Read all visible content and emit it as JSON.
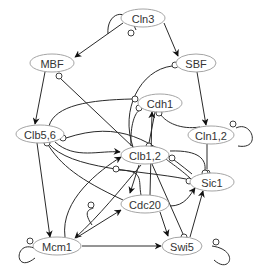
{
  "nodes": [
    {
      "id": "Cln3",
      "label": "Cln3"
    },
    {
      "id": "MBF",
      "label": "MBF"
    },
    {
      "id": "SBF",
      "label": "SBF"
    },
    {
      "id": "Cdh1",
      "label": "Cdh1"
    },
    {
      "id": "Clb56",
      "label": "Clb5,6"
    },
    {
      "id": "Cln12",
      "label": "Cln1,2"
    },
    {
      "id": "Clb12",
      "label": "Clb1,2"
    },
    {
      "id": "Sic1",
      "label": "Sic1"
    },
    {
      "id": "Cdc20",
      "label": "Cdc20"
    },
    {
      "id": "Mcm1",
      "label": "Mcm1"
    },
    {
      "id": "Swi5",
      "label": "Swi5"
    }
  ],
  "edges": [
    {
      "from": "Cln3",
      "to": "Cln3",
      "type": "inhibit"
    },
    {
      "from": "Cln3",
      "to": "MBF",
      "type": "activate"
    },
    {
      "from": "Cln3",
      "to": "SBF",
      "type": "activate"
    },
    {
      "from": "MBF",
      "to": "Clb56",
      "type": "activate"
    },
    {
      "from": "SBF",
      "to": "Cln12",
      "type": "activate"
    },
    {
      "from": "Cln12",
      "to": "Cln12",
      "type": "inhibit"
    },
    {
      "from": "Cln12",
      "to": "Sic1",
      "type": "inhibit"
    },
    {
      "from": "Cln12",
      "to": "Cdh1",
      "type": "inhibit"
    },
    {
      "from": "Clb12",
      "to": "MBF",
      "type": "inhibit"
    },
    {
      "from": "Clb12",
      "to": "SBF",
      "type": "inhibit"
    },
    {
      "from": "Clb12",
      "to": "Cdh1",
      "type": "inhibit"
    },
    {
      "from": "Clb12",
      "to": "Sic1",
      "type": "inhibit"
    },
    {
      "from": "Clb12",
      "to": "Cdc20",
      "type": "activate"
    },
    {
      "from": "Clb12",
      "to": "Mcm1",
      "type": "activate"
    },
    {
      "from": "Clb12",
      "to": "Swi5",
      "type": "inhibit"
    },
    {
      "from": "Clb56",
      "to": "Cdh1",
      "type": "inhibit"
    },
    {
      "from": "Clb56",
      "to": "Clb12",
      "type": "activate"
    },
    {
      "from": "Clb56",
      "to": "Sic1",
      "type": "inhibit"
    },
    {
      "from": "Clb56",
      "to": "Mcm1",
      "type": "activate"
    },
    {
      "from": "Sic1",
      "to": "Clb56",
      "type": "inhibit"
    },
    {
      "from": "Sic1",
      "to": "Clb12",
      "type": "inhibit"
    },
    {
      "from": "Cdh1",
      "to": "Clb12",
      "type": "inhibit"
    },
    {
      "from": "Cdc20",
      "to": "Cdh1",
      "type": "activate"
    },
    {
      "from": "Cdc20",
      "to": "Clb12",
      "type": "inhibit"
    },
    {
      "from": "Cdc20",
      "to": "Clb56",
      "type": "inhibit"
    },
    {
      "from": "Cdc20",
      "to": "Sic1",
      "type": "activate"
    },
    {
      "from": "Cdc20",
      "to": "Swi5",
      "type": "activate"
    },
    {
      "from": "Cdc20",
      "to": "Cdc20",
      "type": "inhibit"
    },
    {
      "from": "Mcm1",
      "to": "Mcm1",
      "type": "inhibit"
    },
    {
      "from": "Mcm1",
      "to": "Clb12",
      "type": "activate"
    },
    {
      "from": "Mcm1",
      "to": "Cdc20",
      "type": "activate"
    },
    {
      "from": "Mcm1",
      "to": "Swi5",
      "type": "activate"
    },
    {
      "from": "Swi5",
      "to": "Sic1",
      "type": "activate"
    },
    {
      "from": "Swi5",
      "to": "Swi5",
      "type": "inhibit"
    }
  ]
}
